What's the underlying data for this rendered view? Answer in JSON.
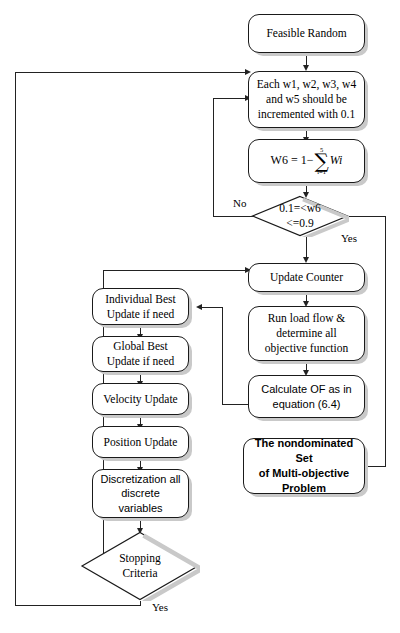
{
  "diagram": {
    "colors": {
      "line": "#222222",
      "box_border": "#1a1a1a",
      "box_fill": "#ffffff",
      "shadow": "#c9c9c9",
      "background": "#ffffff"
    },
    "nodes": {
      "feasible_random": {
        "label": "Feasible Random",
        "shape": "rounded-rectangle",
        "font": "serif"
      },
      "increment_weights": {
        "label": "Each w1, w2, w3, w4\nand w5 should be\nincremented with 0.1",
        "shape": "rounded-rectangle",
        "font": "serif"
      },
      "w6_formula": {
        "shape": "rounded-rectangle",
        "font": "serif",
        "lhs": "W6 = 1−",
        "sum_upper": "5",
        "sum_symbol": "∑",
        "sum_lower": "i=1",
        "sum_term": "Wi",
        "plain": "W6 = 1 − ∑(i=1 to 5) Wi"
      },
      "w6_check": {
        "label": "0.1=<w6\n<=0.9",
        "shape": "diamond",
        "font": "serif"
      },
      "update_counter": {
        "label": "Update Counter",
        "shape": "rounded-rectangle",
        "font": "serif"
      },
      "run_load_flow": {
        "label": "Run load flow &\ndetermine all\nobjective function",
        "shape": "rounded-rectangle",
        "font": "serif"
      },
      "calculate_of": {
        "label": "Calculate OF as in\nequation (6.4)",
        "shape": "rounded-rectangle",
        "font": "sans"
      },
      "nondominated_set": {
        "label": "The nondominated Set\nof Multi-objective\nProblem",
        "shape": "rounded-rectangle",
        "font": "sans-bold"
      },
      "individual_best": {
        "label": "Individual Best\nUpdate if need",
        "shape": "rounded-rectangle",
        "font": "serif"
      },
      "global_best": {
        "label": "Global Best\nUpdate if need",
        "shape": "rounded-rectangle",
        "font": "serif"
      },
      "velocity_update": {
        "label": "Velocity Update",
        "shape": "rounded-rectangle",
        "font": "serif"
      },
      "position_update": {
        "label": "Position Update",
        "shape": "rounded-rectangle",
        "font": "serif"
      },
      "discretization": {
        "label": "Discretization all\ndiscrete\nvariables",
        "shape": "rounded-rectangle",
        "font": "sans"
      },
      "stopping_criteria": {
        "label": "Stopping\nCriteria",
        "shape": "diamond",
        "font": "serif"
      }
    },
    "edge_labels": {
      "w6_no": "No",
      "w6_yes": "Yes",
      "stop_no": "No",
      "stop_yes": "Yes"
    }
  }
}
